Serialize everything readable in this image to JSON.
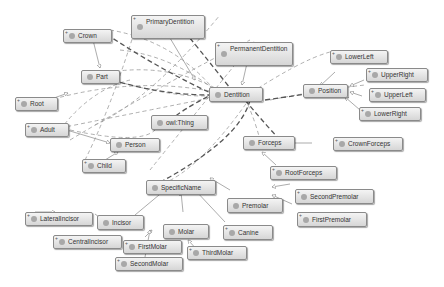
{
  "diagram": {
    "type": "ontology-graph",
    "nodes": [
      {
        "id": "crown",
        "label": "Crown",
        "expandable": true
      },
      {
        "id": "primary_dentition",
        "label": "PrimaryDentition",
        "expandable": true
      },
      {
        "id": "permanent_dentition",
        "label": "PermanentDentition",
        "expandable": true
      },
      {
        "id": "part",
        "label": "Part",
        "expandable": false
      },
      {
        "id": "dentition",
        "label": "Dentition",
        "expandable": false
      },
      {
        "id": "position",
        "label": "Position",
        "expandable": false
      },
      {
        "id": "lower_left",
        "label": "LowerLeft",
        "expandable": true
      },
      {
        "id": "upper_right",
        "label": "UpperRight",
        "expandable": true
      },
      {
        "id": "upper_left",
        "label": "UpperLeft",
        "expandable": true
      },
      {
        "id": "lower_right",
        "label": "LowerRight",
        "expandable": true
      },
      {
        "id": "root",
        "label": "Root",
        "expandable": true
      },
      {
        "id": "adult",
        "label": "Adult",
        "expandable": true
      },
      {
        "id": "owl_thing",
        "label": "owl:Thing",
        "expandable": false
      },
      {
        "id": "person",
        "label": "Person",
        "expandable": false
      },
      {
        "id": "child",
        "label": "Child",
        "expandable": true
      },
      {
        "id": "forceps",
        "label": "Forceps",
        "expandable": false
      },
      {
        "id": "crown_forceps",
        "label": "CrownForceps",
        "expandable": true
      },
      {
        "id": "root_forceps",
        "label": "RootForceps",
        "expandable": true
      },
      {
        "id": "specific_name",
        "label": "SpecificName",
        "expandable": false
      },
      {
        "id": "premolar",
        "label": "Premolar",
        "expandable": false
      },
      {
        "id": "second_premolar",
        "label": "SecondPremolar",
        "expandable": true
      },
      {
        "id": "first_premolar",
        "label": "FirstPremolar",
        "expandable": true
      },
      {
        "id": "lateral_incisor",
        "label": "LateralIncisor",
        "expandable": true
      },
      {
        "id": "incisor",
        "label": "Incisor",
        "expandable": false
      },
      {
        "id": "central_incisor",
        "label": "CentralIncisor",
        "expandable": true
      },
      {
        "id": "molar",
        "label": "Molar",
        "expandable": false
      },
      {
        "id": "canine",
        "label": "Canine",
        "expandable": true
      },
      {
        "id": "first_molar",
        "label": "FirstMolar",
        "expandable": true
      },
      {
        "id": "third_molar",
        "label": "ThirdMolar",
        "expandable": true
      },
      {
        "id": "second_molar",
        "label": "SecondMolar",
        "expandable": true
      }
    ],
    "subclass_edges": [
      [
        "lower_left",
        "position"
      ],
      [
        "upper_right",
        "position"
      ],
      [
        "upper_left",
        "position"
      ],
      [
        "lower_right",
        "position"
      ],
      [
        "crown_forceps",
        "forceps"
      ],
      [
        "root_forceps",
        "forceps"
      ],
      [
        "second_premolar",
        "premolar"
      ],
      [
        "first_premolar",
        "premolar"
      ],
      [
        "lateral_incisor",
        "incisor"
      ],
      [
        "central_incisor",
        "incisor"
      ],
      [
        "first_molar",
        "molar"
      ],
      [
        "second_molar",
        "molar"
      ],
      [
        "third_molar",
        "molar"
      ],
      [
        "premolar",
        "specific_name"
      ],
      [
        "incisor",
        "specific_name"
      ],
      [
        "molar",
        "specific_name"
      ],
      [
        "canine",
        "specific_name"
      ],
      [
        "crown",
        "part"
      ],
      [
        "root",
        "part"
      ],
      [
        "adult",
        "person"
      ],
      [
        "child",
        "person"
      ],
      [
        "primary_dentition",
        "dentition"
      ],
      [
        "permanent_dentition",
        "dentition"
      ]
    ],
    "colors": {
      "node_fill_top": "#f4f4f4",
      "node_fill_bottom": "#d6d6d6",
      "node_border": "#8a8a8a",
      "dot": "#a8a8a8",
      "edge_dark": "#555555",
      "edge_light": "#9a9a9a"
    }
  }
}
